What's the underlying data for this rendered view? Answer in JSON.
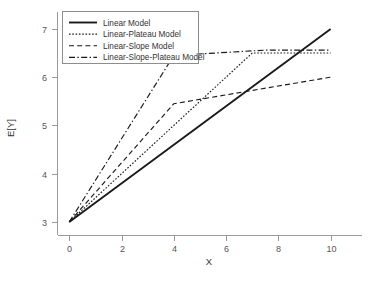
{
  "chart_data": {
    "type": "line",
    "title": "",
    "xlabel": "X",
    "ylabel": "E[Y]",
    "xlim": [
      -0.45,
      11.2
    ],
    "ylim": [
      2.72,
      7.35
    ],
    "xticks": [
      0,
      2,
      4,
      6,
      8,
      10
    ],
    "xtick_labels": [
      "0",
      "2",
      "4",
      "6",
      "8",
      "10"
    ],
    "yticks": [
      3,
      4,
      5,
      6,
      7
    ],
    "ytick_labels": [
      "3",
      "4",
      "5",
      "6",
      "7"
    ],
    "grid": false,
    "legend_position": "top-left",
    "series": [
      {
        "name": "Linear Model",
        "style": "solid",
        "dash": "none",
        "width": 1.9,
        "color": "#1a1a1a",
        "x": [
          0,
          10
        ],
        "y": [
          3.0,
          7.0
        ]
      },
      {
        "name": "Linear-Plateau Model",
        "style": "dotted",
        "dash": "1.6,1.7",
        "width": 1.15,
        "color": "#1a1a1a",
        "x": [
          0,
          7,
          10
        ],
        "y": [
          3.0,
          6.5,
          6.5
        ]
      },
      {
        "name": "Linear-Slope Model",
        "style": "dashed",
        "dash": "5,3.2",
        "width": 1.15,
        "color": "#1a1a1a",
        "x": [
          0,
          4,
          10
        ],
        "y": [
          3.0,
          5.45,
          6.0
        ]
      },
      {
        "name": "Linear-Slope-Plateau Model",
        "style": "dash-dot",
        "dash": "6,2.4,1.4,2.4",
        "width": 1.15,
        "color": "#1a1a1a",
        "x": [
          0,
          4,
          7.5,
          10
        ],
        "y": [
          3.0,
          6.45,
          6.56,
          6.56
        ]
      }
    ]
  },
  "legend": {
    "entries": [
      {
        "label": "Linear Model"
      },
      {
        "label": "Linear-Plateau Model"
      },
      {
        "label": "Linear-Slope Model"
      },
      {
        "label": "Linear-Slope-Plateau Model"
      }
    ]
  },
  "axes": {
    "x_title": "X",
    "y_title": "E[Y]"
  }
}
